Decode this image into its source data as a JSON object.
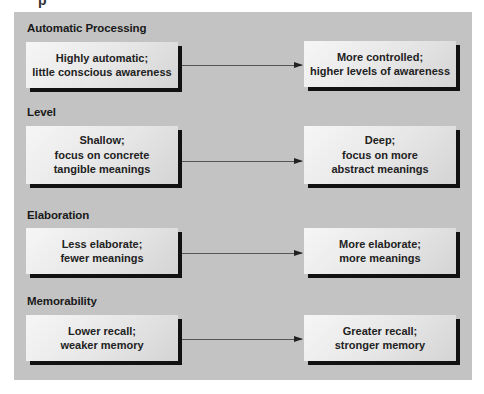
{
  "diagram": {
    "cropped_top_text": "p",
    "rows": [
      {
        "label": "Automatic Processing",
        "left": "Highly automatic;\nlittle conscious awareness",
        "right": "More controlled;\nhigher levels of awareness"
      },
      {
        "label": "Level",
        "left": "Shallow;\nfocus on concrete\ntangible meanings",
        "right": "Deep;\nfocus on more\nabstract meanings"
      },
      {
        "label": "Elaboration",
        "left": "Less elaborate;\nfewer meanings",
        "right": "More elaborate;\nmore meanings"
      },
      {
        "label": "Memorability",
        "left": "Lower recall;\nweaker memory",
        "right": "Greater recall;\nstronger memory"
      }
    ],
    "colors": {
      "panel": "#c3c3c3",
      "box": "#eeeeee",
      "shadow": "#111111",
      "arrow": "#555555"
    }
  }
}
